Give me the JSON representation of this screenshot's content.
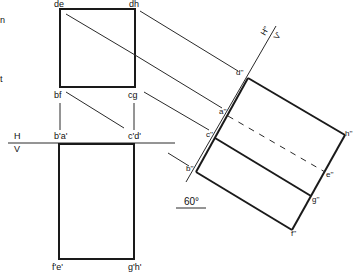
{
  "diagram": {
    "type": "orthographic-projection-auxiliary-view",
    "edge_text": {
      "fragment_1": "n",
      "fragment_2": "t"
    },
    "reference_lines": {
      "main": {
        "upper": "H",
        "lower": "V"
      },
      "auxiliary": {
        "upper": "H''",
        "lower": "V'"
      }
    },
    "plan_view": {
      "labels": {
        "top_left": "de",
        "top_right": "dh",
        "bottom_left": "bf",
        "bottom_right": "cg"
      }
    },
    "elevation_view": {
      "labels": {
        "top_left": "b'a'",
        "top_right": "c'd'",
        "bottom_left": "f'e'",
        "bottom_right": "g'h'"
      }
    },
    "auxiliary_view": {
      "labels": {
        "d": "d''",
        "a": "a''",
        "c": "c''",
        "b": "b''",
        "h": "h''",
        "e": "e''",
        "g": "g''",
        "f": "f''"
      }
    },
    "angle": {
      "label": "60°"
    }
  }
}
